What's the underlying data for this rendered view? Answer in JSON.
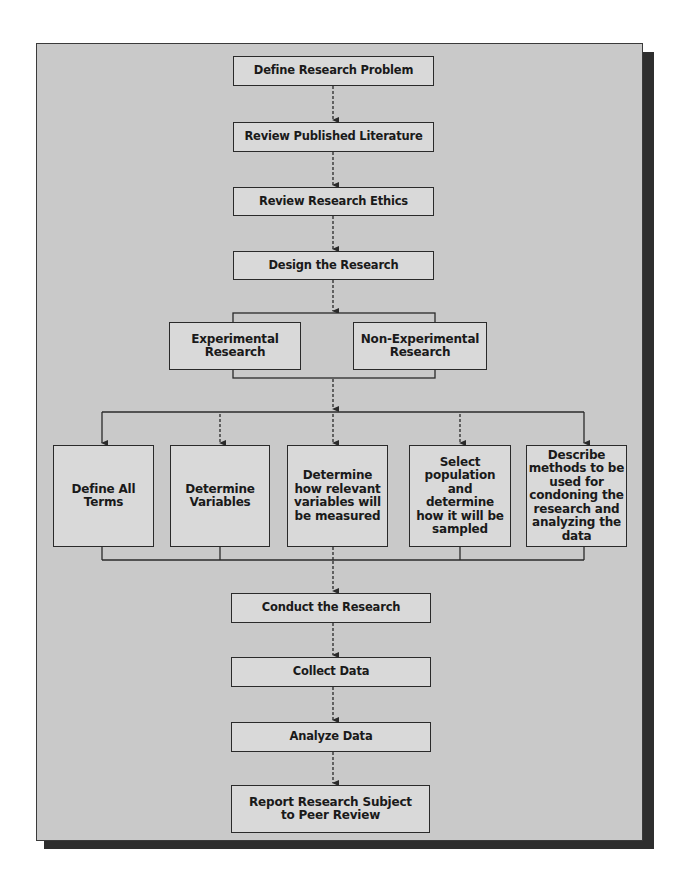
{
  "diagram": {
    "type": "flowchart",
    "colors": {
      "panel": "#c9c9c9",
      "box": "#d9d9d9",
      "stroke": "#2a2a2a",
      "shadow": "#2e2e2e"
    },
    "steps": [
      {
        "id": "define_problem",
        "label": "Define Research Problem"
      },
      {
        "id": "review_literature",
        "label": "Review Published Literature"
      },
      {
        "id": "review_ethics",
        "label": "Review Research Ethics"
      },
      {
        "id": "design",
        "label": "Design the Research"
      }
    ],
    "design_types": [
      {
        "id": "experimental",
        "label": "Experimental Research"
      },
      {
        "id": "non_experimental",
        "label": "Non-Experimental Research"
      }
    ],
    "design_tasks": [
      {
        "id": "define_terms",
        "label": "Define All Terms"
      },
      {
        "id": "determine_variables",
        "label": "Determine Variables"
      },
      {
        "id": "measure_variables",
        "label": "Determine how relevant variables will be measured"
      },
      {
        "id": "select_population",
        "label": "Select population and determine how it will be sampled"
      },
      {
        "id": "describe_methods",
        "label": "Describe methods to be used for condoning the research and analyzing the data"
      }
    ],
    "final_steps": [
      {
        "id": "conduct",
        "label": "Conduct the Research"
      },
      {
        "id": "collect",
        "label": "Collect Data"
      },
      {
        "id": "analyze",
        "label": "Analyze Data"
      },
      {
        "id": "report",
        "label": "Report Research Subject to Peer Review"
      }
    ]
  }
}
